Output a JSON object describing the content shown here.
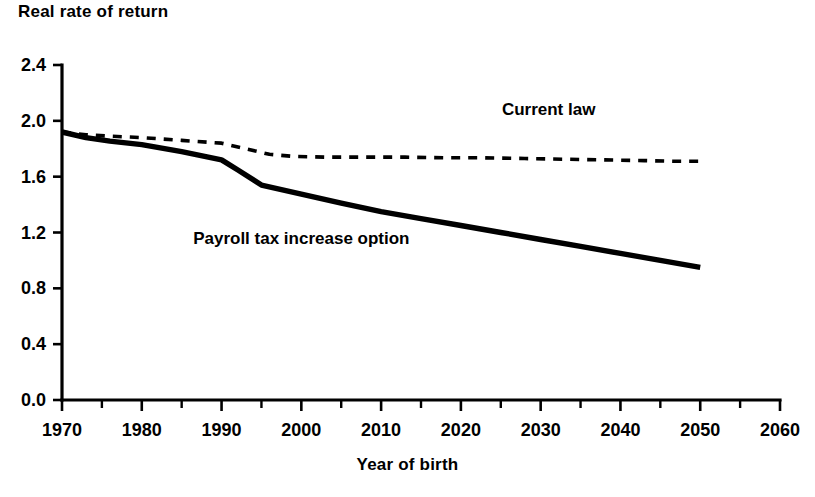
{
  "chart_data": {
    "type": "line",
    "title": "Real rate of return",
    "subtitle": "",
    "xlabel": "Year of birth",
    "ylabel": "Real rate of return",
    "xlim": [
      1970,
      2060
    ],
    "ylim": [
      0.0,
      2.4
    ],
    "grid": false,
    "legend_position": "inline-annotations",
    "x_ticks": [
      1970,
      1980,
      1990,
      2000,
      2010,
      2020,
      2030,
      2040,
      2050,
      2060
    ],
    "x_tick_labels": [
      "1970",
      "1980",
      "1990",
      "2000",
      "2010",
      "2020",
      "2030",
      "2040",
      "2050",
      "2060"
    ],
    "x_minor_tick_interval": 5,
    "y_ticks": [
      0.0,
      0.4,
      0.8,
      1.2,
      1.6,
      2.0,
      2.4
    ],
    "y_tick_labels": [
      "0.0",
      "0.4",
      "0.8",
      "1.2",
      "1.6",
      "2.0",
      "2.4"
    ],
    "series": [
      {
        "name": "Current law",
        "style": "dashed",
        "color": "#000000",
        "label_x": 2031,
        "label_y": 2.04,
        "x": [
          1970,
          1973,
          1976,
          1980,
          1985,
          1990,
          1993,
          1996,
          1999,
          2003,
          2008,
          2013,
          2018,
          2023,
          2028,
          2033,
          2038,
          2043,
          2047,
          2050
        ],
        "values": [
          1.92,
          1.9,
          1.89,
          1.88,
          1.86,
          1.84,
          1.8,
          1.76,
          1.745,
          1.74,
          1.74,
          1.74,
          1.735,
          1.735,
          1.73,
          1.725,
          1.72,
          1.715,
          1.71,
          1.71
        ]
      },
      {
        "name": "Payroll tax increase option",
        "style": "solid",
        "color": "#000000",
        "label_x": 2000,
        "label_y": 1.115,
        "x": [
          1970,
          1973,
          1976,
          1980,
          1985,
          1990,
          1992,
          1995,
          2000,
          2005,
          2010,
          2015,
          2020,
          2025,
          2030,
          2035,
          2040,
          2045,
          2050
        ],
        "values": [
          1.92,
          1.88,
          1.855,
          1.83,
          1.78,
          1.72,
          1.65,
          1.54,
          1.475,
          1.41,
          1.35,
          1.3,
          1.25,
          1.2,
          1.15,
          1.1,
          1.05,
          1.0,
          0.95
        ]
      }
    ]
  }
}
